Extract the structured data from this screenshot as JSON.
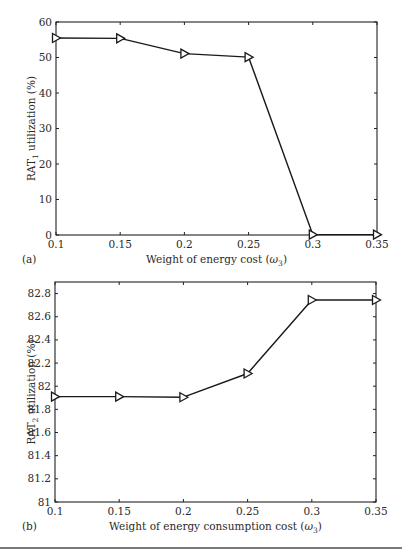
{
  "chart_data": [
    {
      "type": "line",
      "panel": "(a)",
      "title": "",
      "xlabel": "Weight of energy cost (ω3)",
      "xlabel_main": "Weight of energy cost (",
      "xlabel_sym": "ω",
      "xlabel_sub": "3",
      "xlabel_end": ")",
      "ylabel": "RAT1 utilization (%)",
      "ylabel_main": "RAT",
      "ylabel_sub": "1",
      "ylabel_end": " utilization (%)",
      "x": [
        0.1,
        0.15,
        0.2,
        0.25,
        0.3,
        0.35
      ],
      "x_tick_labels": [
        "0.1",
        "0.15",
        "0.2",
        "0.25",
        "0.3",
        "0.35"
      ],
      "y_ticks": [
        0,
        10,
        20,
        30,
        40,
        50,
        60
      ],
      "y_tick_labels": [
        "0",
        "10",
        "20",
        "30",
        "40",
        "50",
        "60"
      ],
      "series": [
        {
          "name": "RAT1 utilization",
          "marker": "right-triangle",
          "values": [
            55.5,
            55.4,
            51.1,
            50.1,
            0.1,
            0.1
          ]
        }
      ],
      "xlim": [
        0.1,
        0.35
      ],
      "ylim": [
        0,
        60
      ],
      "grid": false,
      "legend": null
    },
    {
      "type": "line",
      "panel": "(b)",
      "title": "",
      "xlabel": "Weight of energy consumption cost (ω3)",
      "xlabel_main": "Weight of energy consumption cost (",
      "xlabel_sym": "ω",
      "xlabel_sub": "3",
      "xlabel_end": ")",
      "ylabel": "RAT2 utilization (%)",
      "ylabel_main": "RAT",
      "ylabel_sub": "2",
      "ylabel_end": " utilization (%)",
      "x": [
        0.1,
        0.15,
        0.2,
        0.25,
        0.3,
        0.35
      ],
      "x_tick_labels": [
        "0.1",
        "0.15",
        "0.2",
        "0.25",
        "0.3",
        "0.35"
      ],
      "y_ticks": [
        81,
        81.2,
        81.4,
        81.6,
        81.8,
        82,
        82.2,
        82.4,
        82.6,
        82.8
      ],
      "y_tick_labels": [
        "81",
        "81.2",
        "81.4",
        "81.6",
        "81.8",
        "82",
        "82.2",
        "82.4",
        "82.6",
        "82.8"
      ],
      "series": [
        {
          "name": "RAT2 utilization",
          "marker": "right-triangle",
          "values": [
            81.91,
            81.91,
            81.905,
            82.11,
            82.745,
            82.745
          ]
        }
      ],
      "xlim": [
        0.1,
        0.35
      ],
      "ylim": [
        81,
        82.9
      ],
      "grid": false,
      "legend": null
    }
  ],
  "layout": {
    "panels": [
      {
        "left": 56,
        "top": 22,
        "right": 377,
        "bottom": 235
      },
      {
        "left": 55,
        "top": 282,
        "right": 376,
        "bottom": 502
      }
    ]
  }
}
